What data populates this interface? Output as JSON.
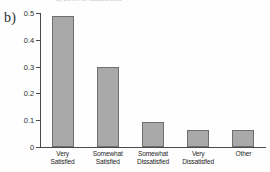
{
  "figure": {
    "panel_label": "b)",
    "top_cut_caption": "a) Level of Satisfaction"
  },
  "chart_data": {
    "type": "bar",
    "title": "",
    "xlabel": "",
    "ylabel": "",
    "categories": [
      "Very Satisfied",
      "Somewhat Satisfied",
      "Somewhat Dissatisfied",
      "Very Dissatisfied",
      "Other"
    ],
    "category_lines": [
      [
        "Very",
        "Satisfied"
      ],
      [
        "Somewhat",
        "Satisfied"
      ],
      [
        "Somewhat",
        "Dissatisfied"
      ],
      [
        "Very",
        "Dissatisfied"
      ],
      [
        "Other",
        ""
      ]
    ],
    "values": [
      0.49,
      0.3,
      0.095,
      0.065,
      0.065
    ],
    "ylim": [
      0,
      0.5
    ],
    "yticks": [
      0,
      0.1,
      0.2,
      0.3,
      0.4,
      0.5
    ],
    "ytick_labels": [
      "0",
      "0.1",
      "0.2",
      "0.3",
      "0.4",
      "0.5"
    ],
    "grid": false,
    "legend": null,
    "bar_color": "#a9a9a9",
    "bar_border_color": "#6f6f6f",
    "axis_color": "#4a4a4a"
  }
}
